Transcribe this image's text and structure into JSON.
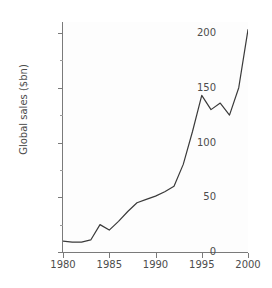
{
  "chart_data": {
    "type": "line",
    "title": "",
    "subtitle": "",
    "xlabel": "",
    "ylabel": "Global sales ($bn)",
    "xlim": [
      1980,
      2000
    ],
    "ylim": [
      0,
      210
    ],
    "grid": false,
    "legend": false,
    "legend_position": "none",
    "line_color": "#3a3a3a",
    "x_tick_labels": [
      "1980",
      "1985",
      "1990",
      "1995",
      "2000"
    ],
    "x_ticks": [
      1980,
      1985,
      1990,
      1995,
      2000
    ],
    "y_tick_labels": [
      "0",
      "50",
      "100",
      "150",
      "200"
    ],
    "y_ticks": [
      0,
      50,
      100,
      150,
      200
    ],
    "y_minor_ticks": [
      25,
      75,
      125,
      175
    ],
    "x": [
      1980,
      1981,
      1982,
      1983,
      1984,
      1985,
      1986,
      1987,
      1988,
      1989,
      1990,
      1991,
      1992,
      1993,
      1994,
      1995,
      1996,
      1997,
      1998,
      1999,
      2000
    ],
    "series": [
      {
        "name": "Global sales",
        "values": [
          10,
          9,
          9,
          11,
          25,
          20,
          28,
          37,
          45,
          48,
          51,
          55,
          60,
          80,
          110,
          143,
          130,
          136,
          125,
          150,
          203
        ]
      }
    ]
  },
  "axes": {
    "y_axis_title": "Global sales ($bn)"
  }
}
